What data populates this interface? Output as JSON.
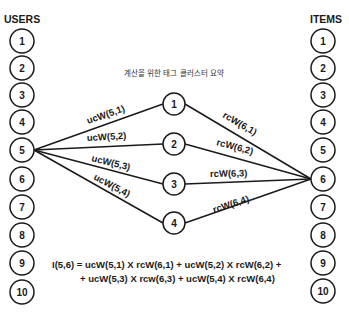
{
  "diagram": {
    "caption": "계산을 위한 태그 클러스터 요약",
    "users": {
      "title": "USERS",
      "nodes": [
        "1",
        "2",
        "3",
        "4",
        "5",
        "6",
        "7",
        "8",
        "9",
        "10"
      ]
    },
    "items": {
      "title": "ITEMS",
      "nodes": [
        "1",
        "2",
        "3",
        "4",
        "5",
        "6",
        "7",
        "8",
        "9",
        "10"
      ]
    },
    "clusters": {
      "nodes": [
        "1",
        "2",
        "3",
        "4"
      ]
    },
    "user_edges": [
      {
        "from": "user-5",
        "to": "cluster-1",
        "label": "ucW(5,1)"
      },
      {
        "from": "user-5",
        "to": "cluster-2",
        "label": "ucW(5,2)"
      },
      {
        "from": "user-5",
        "to": "cluster-3",
        "label": "ucW(5,3)"
      },
      {
        "from": "user-5",
        "to": "cluster-4",
        "label": "ucW(5,4)"
      }
    ],
    "item_edges": [
      {
        "from": "cluster-1",
        "to": "item-6",
        "label": "rcW(6,1)"
      },
      {
        "from": "cluster-2",
        "to": "item-6",
        "label": "rcW(6,2)"
      },
      {
        "from": "cluster-3",
        "to": "item-6",
        "label": "rcW(6,3)"
      },
      {
        "from": "cluster-4",
        "to": "item-6",
        "label": "rcW(6,4)"
      }
    ],
    "formula": {
      "line1": "I(5,6) = ucW(5,1) X rcW(6,1) + ucW(5,2) X rcW(6,2) +",
      "line2": "+ ucW(5,3) X rcw(6,3) + ucW(5,4) X rcW(6,4)"
    },
    "colors": {
      "stroke": "#1a1a1a",
      "background": "#ffffff"
    }
  }
}
